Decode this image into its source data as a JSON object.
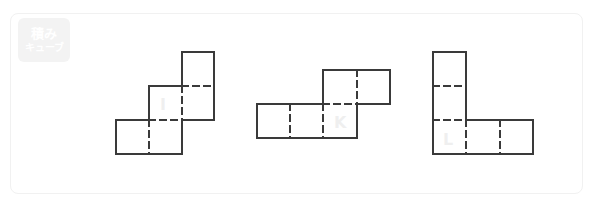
{
  "watermark": {
    "line1": "積み",
    "line2": "キューブ"
  },
  "colors": {
    "stroke": "#3a3a3a",
    "label": "#efefef",
    "frame": "#f1f1f1",
    "background": "#ffffff"
  },
  "figures": [
    {
      "label": "I",
      "description": "staircase of three squares"
    },
    {
      "label": "K",
      "description": "row of three squares with two squares offset above-right"
    },
    {
      "label": "L",
      "description": "L-shape: column of three squares with two extra squares to the right at bottom"
    }
  ]
}
